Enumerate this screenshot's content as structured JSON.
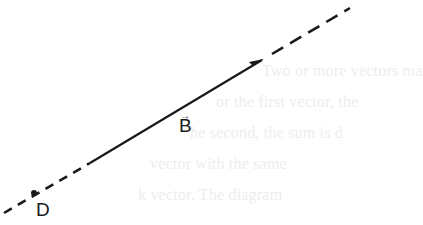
{
  "diagram": {
    "vector": {
      "name": "B",
      "label": "B",
      "arrow_glyph": "→",
      "color": "#1a1a1a",
      "line": {
        "dash_start": [
          4,
          213
        ],
        "solid_start": [
          90,
          163
        ],
        "solid_end": [
          264,
          59
        ],
        "dash_end": [
          350,
          8
        ]
      }
    },
    "point": {
      "name": "D",
      "label": "D",
      "position": [
        34,
        193
      ]
    },
    "bleed_through_text": [
      "Two or more vectors ma",
      "or the first vector, the",
      "he second, the sum is d",
      "vector with the same",
      "k vector. The diagram"
    ]
  }
}
